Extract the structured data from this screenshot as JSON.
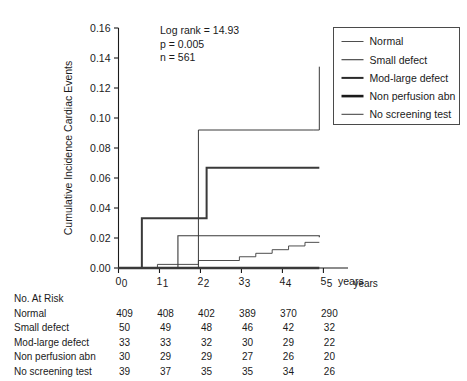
{
  "chart_data": {
    "type": "line",
    "title": "",
    "subtitle": "",
    "xlabel": "years",
    "ylabel": "Cumulative Incidence Cardiac Events",
    "xlim": [
      0,
      5.6
    ],
    "ylim": [
      0,
      0.16
    ],
    "xticks": [
      "0",
      "1",
      "2",
      "3",
      "4",
      "5"
    ],
    "xtick_values": [
      0,
      1,
      2,
      3,
      4,
      5
    ],
    "yticks": [
      "0.00",
      "0.02",
      "0.04",
      "0.06",
      "0.08",
      "0.10",
      "0.12",
      "0.14",
      "0.16"
    ],
    "ytick_values": [
      0.0,
      0.02,
      0.04,
      0.06,
      0.08,
      0.1,
      0.12,
      0.14,
      0.16
    ],
    "grid": false,
    "legend_position": "top-right",
    "curve_style": "step-post",
    "annotations": [
      "Log rank = 14.93",
      "p = 0.005",
      "n = 561"
    ],
    "series": [
      {
        "name": "Normal",
        "line_width": 0.9,
        "color": "#3a3a3a",
        "x": [
          0,
          0.95,
          1.45,
          1.95,
          2.55,
          2.95,
          3.35,
          3.75,
          4.15,
          4.55,
          4.9
        ],
        "y": [
          0.0,
          0.0024,
          0.0024,
          0.005,
          0.005,
          0.0075,
          0.0098,
          0.0122,
          0.0147,
          0.0171,
          0.0171
        ]
      },
      {
        "name": "Small defect",
        "line_width": 1.1,
        "color": "#3a3a3a",
        "x": [
          0,
          1.45,
          4.75,
          4.9
        ],
        "y": [
          0.0,
          0.0215,
          0.0215,
          0.0205
        ]
      },
      {
        "name": "Mod-large defect",
        "line_width": 2.0,
        "color": "#2a2a2a",
        "x": [
          0,
          0.57,
          2.15,
          4.9
        ],
        "y": [
          0.0,
          0.0332,
          0.0668,
          0.0668
        ]
      },
      {
        "name": "Non perfusion abn",
        "line_width": 2.6,
        "color": "#1a1a1a",
        "x": [
          0,
          4.9
        ],
        "y": [
          0.0,
          0.0
        ]
      },
      {
        "name": "No screening test",
        "line_width": 1.0,
        "color": "#3a3a3a",
        "x": [
          0,
          1.95,
          4.75,
          4.9
        ],
        "y": [
          0.0,
          0.092,
          0.092,
          0.1342
        ]
      }
    ]
  },
  "legend": {
    "entries": [
      {
        "label": "Normal"
      },
      {
        "label": "Small defect"
      },
      {
        "label": "Mod-large defect"
      },
      {
        "label": "Non perfusion abn"
      },
      {
        "label": "No screening test"
      }
    ]
  },
  "risk_table": {
    "title": "No. At Risk",
    "columns": [
      "0",
      "1",
      "2",
      "3",
      "4",
      "5"
    ],
    "units_label": "years",
    "rows": [
      {
        "label": "Normal",
        "values": [
          "409",
          "408",
          "402",
          "389",
          "370",
          "290"
        ]
      },
      {
        "label": "Small defect",
        "values": [
          "50",
          "49",
          "48",
          "46",
          "42",
          "32"
        ]
      },
      {
        "label": "Mod-large defect",
        "values": [
          "33",
          "33",
          "32",
          "30",
          "29",
          "22"
        ]
      },
      {
        "label": "Non perfusion abn",
        "values": [
          "30",
          "29",
          "29",
          "27",
          "26",
          "20"
        ]
      },
      {
        "label": "No screening test",
        "values": [
          "39",
          "37",
          "35",
          "35",
          "34",
          "26"
        ]
      }
    ]
  }
}
